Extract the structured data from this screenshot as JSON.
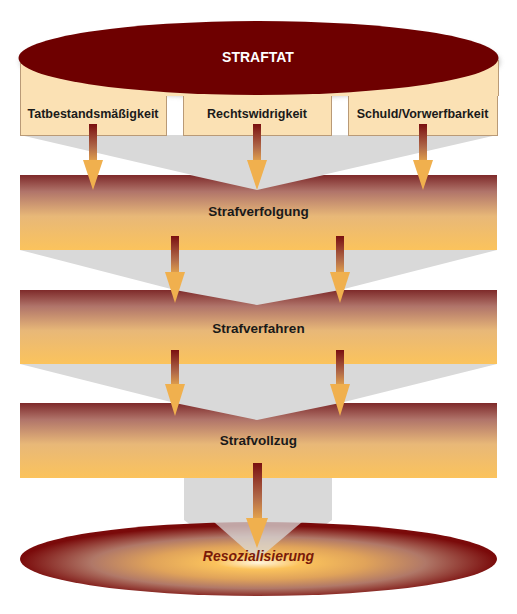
{
  "diagram": {
    "title": "STRAFTAT",
    "criteria": [
      {
        "label": "Tatbestandsmäßigkeit"
      },
      {
        "label": "Rechtswidrigkeit"
      },
      {
        "label": "Schuld/Vorwerfbarkeit"
      }
    ],
    "stages": [
      {
        "label": "Strafverfolgung"
      },
      {
        "label": "Strafverfahren"
      },
      {
        "label": "Strafvollzug"
      }
    ],
    "outcome": {
      "label": "Resozialisierung"
    },
    "colors": {
      "dark_red": "#6e0000",
      "beige": "#fbe1b4",
      "amber": "#fbc35c",
      "funnel_gray": "#d9d9d9",
      "outcome_text": "#7a1a0a"
    }
  }
}
